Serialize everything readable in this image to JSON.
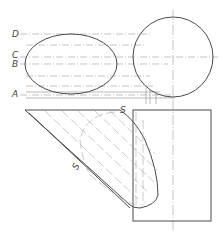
{
  "drawing": {
    "title": "Cylinder section projection",
    "labels": {
      "D": "D",
      "C": "C",
      "B": "B",
      "A": "A",
      "S_top": "S",
      "S_bottom": "S"
    },
    "colors": {
      "line": "#4a4a4a",
      "construction": "#9a9a9a",
      "background": "#ffffff"
    }
  }
}
